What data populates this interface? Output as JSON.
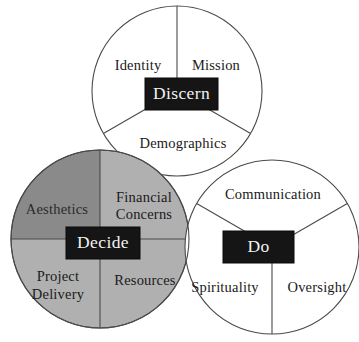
{
  "diagram": {
    "background_color": "#ffffff",
    "outline_color": "#4a4a4a",
    "core_box_color": "#151515",
    "core_box_text_color": "#f2f2f2",
    "circles": [
      {
        "id": "discern",
        "core_label": "Discern",
        "fill_color": "#ffffff",
        "sectors": [
          {
            "id": "identity",
            "label": "Identity",
            "fill_color": "#ffffff"
          },
          {
            "id": "mission",
            "label": "Mission",
            "fill_color": "#ffffff"
          },
          {
            "id": "demographics",
            "label": "Demographics",
            "fill_color": "#ffffff"
          }
        ]
      },
      {
        "id": "decide",
        "core_label": "Decide",
        "fill_color": "#b0b0b0",
        "sectors": [
          {
            "id": "aesthetics",
            "label": "Aesthetics",
            "fill_color": "#8a8a8a"
          },
          {
            "id": "financial-concerns",
            "label_line1": "Financial",
            "label_line2": "Concerns",
            "fill_color": "#b0b0b0"
          },
          {
            "id": "project-delivery",
            "label_line1": "Project",
            "label_line2": "Delivery",
            "fill_color": "#b0b0b0"
          },
          {
            "id": "resources",
            "label": "Resources",
            "fill_color": "#b0b0b0"
          }
        ]
      },
      {
        "id": "do",
        "core_label": "Do",
        "fill_color": "#ffffff",
        "sectors": [
          {
            "id": "communication",
            "label": "Communication",
            "fill_color": "#ffffff"
          },
          {
            "id": "spirituality",
            "label": "Spirituality",
            "fill_color": "#ffffff"
          },
          {
            "id": "oversight",
            "label": "Oversight",
            "fill_color": "#ffffff"
          }
        ]
      }
    ]
  }
}
